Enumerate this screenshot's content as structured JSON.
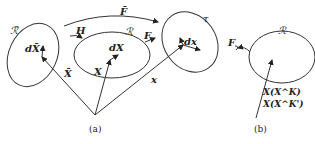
{
  "diagram": {
    "panel_a": {
      "caption": "(a)",
      "regions": {
        "R_bar": "ℛ̄",
        "R": "ℛ",
        "tau": "τ"
      },
      "maps": {
        "F_bar": "F̄",
        "H": "H",
        "F": "F"
      },
      "vectors": {
        "X_bar": "X̄",
        "X": "X",
        "x": "x"
      },
      "differentials": {
        "dX_bar": "dX̄",
        "dX": "dX",
        "dx": "dx"
      }
    },
    "panel_b": {
      "caption": "(b)",
      "region": "ℛ",
      "map": "F",
      "labels": [
        "X(X^K)",
        "X(X^K')"
      ]
    }
  }
}
